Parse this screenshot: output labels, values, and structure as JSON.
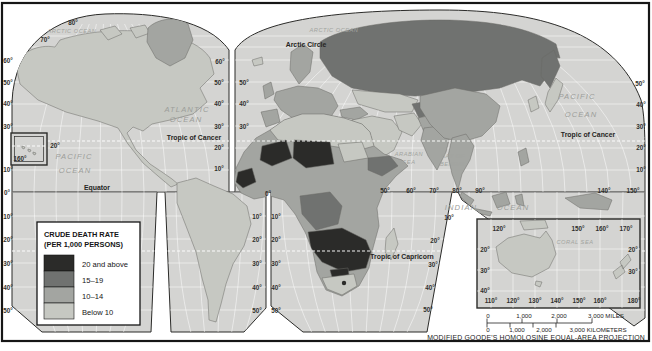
{
  "map": {
    "colors": {
      "ocean": "#d4d4d2",
      "below_10": "#c6c8c2",
      "rate_10_14": "#a3a5a1",
      "rate_15_19": "#707270",
      "rate_20_above": "#2b2b29",
      "frame": "#161616"
    },
    "legend": {
      "title_lines": [
        "CRUDE DEATH RATE",
        "(PER 1,000 PERSONS)"
      ],
      "items": [
        {
          "label": "20 and above",
          "color": "#2b2b29"
        },
        {
          "label": "15–19",
          "color": "#707270"
        },
        {
          "label": "10–14",
          "color": "#a3a5a1"
        },
        {
          "label": "Below 10",
          "color": "#c6c8c2"
        }
      ]
    },
    "projection_note": "MODIFIED GOODE'S HOMOLOSINE EQUAL-AREA PROJECTION",
    "scale_bar": {
      "miles_labels": [
        "0",
        "1,000",
        "2,000",
        "3,000 MILES"
      ],
      "kilometers_labels": [
        "0",
        "1,000",
        "2,000",
        "3,000 KILOMETERS"
      ]
    },
    "labels": [
      {
        "t": "80°",
        "x": 73,
        "y": 25,
        "c": "lat"
      },
      {
        "t": "70°",
        "x": 45,
        "y": 42,
        "c": "lat"
      },
      {
        "t": "ARCTIC OCEAN",
        "x": 72,
        "y": 33,
        "c": "oceansm"
      },
      {
        "t": "ARCTIC OCEAN",
        "x": 334,
        "y": 32,
        "c": "oceansm"
      },
      {
        "t": "Arctic Circle",
        "x": 306,
        "y": 47,
        "c": "line"
      },
      {
        "t": "60°",
        "x": 8,
        "y": 63,
        "c": "lat"
      },
      {
        "t": "50°",
        "x": 8,
        "y": 85,
        "c": "lat"
      },
      {
        "t": "40°",
        "x": 8,
        "y": 106,
        "c": "lat"
      },
      {
        "t": "30°",
        "x": 8,
        "y": 129,
        "c": "lat"
      },
      {
        "t": "10°",
        "x": 8,
        "y": 172,
        "c": "lat"
      },
      {
        "t": "0°",
        "x": 7,
        "y": 195,
        "c": "lat"
      },
      {
        "t": "10°",
        "x": 8,
        "y": 219,
        "c": "lat"
      },
      {
        "t": "20°",
        "x": 8,
        "y": 242,
        "c": "lat"
      },
      {
        "t": "30°",
        "x": 8,
        "y": 266,
        "c": "lat"
      },
      {
        "t": "40°",
        "x": 8,
        "y": 290,
        "c": "lat"
      },
      {
        "t": "50°",
        "x": 8,
        "y": 313,
        "c": "lat"
      },
      {
        "t": "160°",
        "x": 20,
        "y": 161,
        "c": "lat"
      },
      {
        "t": "20°",
        "x": 55,
        "y": 148,
        "c": "lat"
      },
      {
        "t": "60°",
        "x": 220,
        "y": 64,
        "c": "lat"
      },
      {
        "t": "50°",
        "x": 219,
        "y": 85,
        "c": "lat"
      },
      {
        "t": "50°",
        "x": 244,
        "y": 85,
        "c": "lat"
      },
      {
        "t": "40°",
        "x": 219,
        "y": 106,
        "c": "lat"
      },
      {
        "t": "40°",
        "x": 244,
        "y": 106,
        "c": "lat"
      },
      {
        "t": "30°",
        "x": 219,
        "y": 129,
        "c": "lat"
      },
      {
        "t": "30°",
        "x": 244,
        "y": 129,
        "c": "lat"
      },
      {
        "t": "20°",
        "x": 219,
        "y": 150,
        "c": "lat"
      },
      {
        "t": "10°",
        "x": 219,
        "y": 171,
        "c": "lat"
      },
      {
        "t": "0°",
        "x": 268,
        "y": 196,
        "c": "lat"
      },
      {
        "t": "10°",
        "x": 257,
        "y": 219,
        "c": "lat"
      },
      {
        "t": "10°",
        "x": 276,
        "y": 219,
        "c": "lat"
      },
      {
        "t": "20°",
        "x": 257,
        "y": 242,
        "c": "lat"
      },
      {
        "t": "20°",
        "x": 276,
        "y": 242,
        "c": "lat"
      },
      {
        "t": "30°",
        "x": 257,
        "y": 266,
        "c": "lat"
      },
      {
        "t": "30°",
        "x": 276,
        "y": 266,
        "c": "lat"
      },
      {
        "t": "40°",
        "x": 257,
        "y": 290,
        "c": "lat"
      },
      {
        "t": "40°",
        "x": 276,
        "y": 290,
        "c": "lat"
      },
      {
        "t": "50°",
        "x": 257,
        "y": 313,
        "c": "lat"
      },
      {
        "t": "50°",
        "x": 276,
        "y": 313,
        "c": "lat"
      },
      {
        "t": "20°",
        "x": 435,
        "y": 243,
        "c": "lat"
      },
      {
        "t": "30°",
        "x": 433,
        "y": 267,
        "c": "lat"
      },
      {
        "t": "40°",
        "x": 430,
        "y": 290,
        "c": "lat"
      },
      {
        "t": "50°",
        "x": 428,
        "y": 312,
        "c": "lat"
      },
      {
        "t": "50°",
        "x": 385,
        "y": 193,
        "c": "lat"
      },
      {
        "t": "60°",
        "x": 411,
        "y": 193,
        "c": "lat"
      },
      {
        "t": "70°",
        "x": 434,
        "y": 193,
        "c": "lat"
      },
      {
        "t": "80°",
        "x": 457,
        "y": 193,
        "c": "lat"
      },
      {
        "t": "90°",
        "x": 480,
        "y": 193,
        "c": "lat"
      },
      {
        "t": "140°",
        "x": 604,
        "y": 193,
        "c": "lat"
      },
      {
        "t": "150°",
        "x": 633,
        "y": 193,
        "c": "lat"
      },
      {
        "t": "10°",
        "x": 449,
        "y": 220,
        "c": "lat"
      },
      {
        "t": "50°",
        "x": 640,
        "y": 86,
        "c": "lat"
      },
      {
        "t": "40°",
        "x": 641,
        "y": 107,
        "c": "lat"
      },
      {
        "t": "30°",
        "x": 641,
        "y": 129,
        "c": "lat"
      },
      {
        "t": "20°",
        "x": 641,
        "y": 150,
        "c": "lat"
      },
      {
        "t": "10°",
        "x": 641,
        "y": 172,
        "c": "lat"
      },
      {
        "t": "ATLANTIC",
        "x": 187,
        "y": 112,
        "c": "ocean"
      },
      {
        "t": "OCEAN",
        "x": 186,
        "y": 122,
        "c": "ocean"
      },
      {
        "t": "PACIFIC",
        "x": 74,
        "y": 159,
        "c": "ocean"
      },
      {
        "t": "OCEAN",
        "x": 75,
        "y": 173,
        "c": "ocean"
      },
      {
        "t": "PACIFIC",
        "x": 577,
        "y": 99,
        "c": "ocean"
      },
      {
        "t": "OCEAN",
        "x": 581,
        "y": 117,
        "c": "ocean"
      },
      {
        "t": "INDIAN",
        "x": 461,
        "y": 210,
        "c": "ocean"
      },
      {
        "t": "OCEAN",
        "x": 513,
        "y": 210,
        "c": "ocean"
      },
      {
        "t": "ARABIAN",
        "x": 409,
        "y": 156,
        "c": "oceansm"
      },
      {
        "t": "SEA",
        "x": 409,
        "y": 164,
        "c": "oceansm"
      },
      {
        "t": "BAY OF",
        "x": 453,
        "y": 158,
        "c": "oceansm"
      },
      {
        "t": "BENGAL",
        "x": 453,
        "y": 166,
        "c": "oceansm"
      },
      {
        "t": "CORAL  SEA",
        "x": 575,
        "y": 244,
        "c": "oceansm"
      },
      {
        "t": "Equator",
        "x": 97,
        "y": 190,
        "c": "line"
      },
      {
        "t": "Tropic of Cancer",
        "x": 194,
        "y": 140,
        "c": "line"
      },
      {
        "t": "Tropic of Cancer",
        "x": 588,
        "y": 137,
        "c": "line"
      },
      {
        "t": "Tropic of Capricorn",
        "x": 402,
        "y": 259,
        "c": "line"
      },
      {
        "t": "120°",
        "x": 499,
        "y": 231,
        "c": "lat"
      },
      {
        "t": "150°",
        "x": 578,
        "y": 231,
        "c": "lat"
      },
      {
        "t": "160°",
        "x": 602,
        "y": 231,
        "c": "lat"
      },
      {
        "t": "170°",
        "x": 626,
        "y": 231,
        "c": "lat"
      },
      {
        "t": "20°",
        "x": 485,
        "y": 252,
        "c": "lat"
      },
      {
        "t": "30°",
        "x": 485,
        "y": 273,
        "c": "lat"
      },
      {
        "t": "40°",
        "x": 485,
        "y": 293,
        "c": "lat"
      },
      {
        "t": "20°",
        "x": 633,
        "y": 252,
        "c": "lat"
      },
      {
        "t": "30°",
        "x": 633,
        "y": 274,
        "c": "lat"
      },
      {
        "t": "110°",
        "x": 491,
        "y": 303,
        "c": "lat"
      },
      {
        "t": "120°",
        "x": 513,
        "y": 303,
        "c": "lat"
      },
      {
        "t": "130°",
        "x": 535,
        "y": 303,
        "c": "lat"
      },
      {
        "t": "140°",
        "x": 557,
        "y": 303,
        "c": "lat"
      },
      {
        "t": "150°",
        "x": 579,
        "y": 303,
        "c": "lat"
      },
      {
        "t": "160°",
        "x": 600,
        "y": 303,
        "c": "lat"
      },
      {
        "t": "180°",
        "x": 634,
        "y": 303,
        "c": "lat"
      },
      {
        "t": "0",
        "x": 488,
        "y": 318,
        "c": "scale"
      },
      {
        "t": "1,000",
        "x": 524,
        "y": 318,
        "c": "scale"
      },
      {
        "t": "2,000",
        "x": 559,
        "y": 318,
        "c": "scale"
      },
      {
        "t": "3,000 MILES",
        "x": 606,
        "y": 318,
        "c": "scale"
      },
      {
        "t": "0",
        "x": 488,
        "y": 332,
        "c": "scale"
      },
      {
        "t": "1,000",
        "x": 517,
        "y": 332,
        "c": "scale"
      },
      {
        "t": "2,000",
        "x": 544,
        "y": 332,
        "c": "scale"
      },
      {
        "t": "3,000 KILOMETERS",
        "x": 598,
        "y": 332,
        "c": "scale"
      },
      {
        "t": "MODIFIED GOODE'S HOMOLOSINE EQUAL-AREA PROJECTION",
        "x": 645,
        "y": 340,
        "c": "proj",
        "a": "end"
      }
    ]
  }
}
